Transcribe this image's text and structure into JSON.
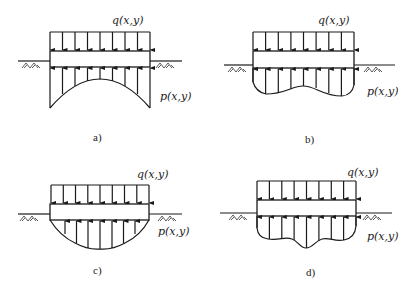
{
  "figure": {
    "panels": [
      {
        "id": "a",
        "caption": "a)",
        "top_load_label": "q(x,y)",
        "reaction_label": "p(x,y)",
        "reaction_shape": "concave (saddle) - max at edges, min at center"
      },
      {
        "id": "b",
        "caption": "b)",
        "top_load_label": "q(x,y)",
        "reaction_label": "p(x,y)",
        "reaction_shape": "wavy - larger at edges, slight dip at center"
      },
      {
        "id": "c",
        "caption": "c)",
        "top_load_label": "q(x,y)",
        "reaction_label": "p(x,y)",
        "reaction_shape": "parabolic - zero at edges, max at center"
      },
      {
        "id": "d",
        "caption": "d)",
        "top_load_label": "q(x,y)",
        "reaction_label": "p(x,y)",
        "reaction_shape": "wavy - max at center with side lobes"
      }
    ]
  }
}
